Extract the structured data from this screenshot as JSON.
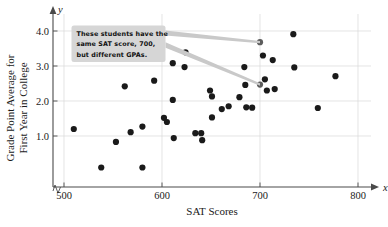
{
  "chart_data": {
    "type": "scatter",
    "title": "",
    "xlabel": "SAT Scores",
    "ylabel": "Grade Point Average for First Year in College",
    "x_var": "x",
    "y_var": "y",
    "xlim": [
      490,
      815
    ],
    "ylim": [
      0,
      4.35
    ],
    "xticks": [
      500,
      600,
      700,
      800
    ],
    "xtick_labels": [
      "500",
      "600",
      "700",
      "800"
    ],
    "yticks": [
      1.0,
      2.0,
      3.0,
      4.0
    ],
    "ytick_labels": [
      "1.0",
      "2.0",
      "3.0",
      "4.0"
    ],
    "grid": true,
    "grid_color": "#d9d9d9",
    "axis_break": true,
    "marker_color": "#1a1a1a",
    "marker_size": 3.1,
    "legend": null,
    "points": [
      {
        "x": 510,
        "y": 1.2
      },
      {
        "x": 538,
        "y": 0.1
      },
      {
        "x": 553,
        "y": 0.83
      },
      {
        "x": 562,
        "y": 2.42
      },
      {
        "x": 568,
        "y": 1.11
      },
      {
        "x": 580,
        "y": 0.1
      },
      {
        "x": 580,
        "y": 1.27
      },
      {
        "x": 592,
        "y": 2.58
      },
      {
        "x": 602,
        "y": 1.52
      },
      {
        "x": 605,
        "y": 1.4
      },
      {
        "x": 611,
        "y": 3.08
      },
      {
        "x": 611,
        "y": 2.03
      },
      {
        "x": 612,
        "y": 0.94
      },
      {
        "x": 623,
        "y": 2.97
      },
      {
        "x": 624,
        "y": 3.39
      },
      {
        "x": 634,
        "y": 1.08
      },
      {
        "x": 640,
        "y": 1.08
      },
      {
        "x": 641,
        "y": 0.88
      },
      {
        "x": 649,
        "y": 2.3
      },
      {
        "x": 651,
        "y": 2.13
      },
      {
        "x": 651,
        "y": 1.53
      },
      {
        "x": 661,
        "y": 1.77
      },
      {
        "x": 668,
        "y": 1.85
      },
      {
        "x": 679,
        "y": 2.11
      },
      {
        "x": 684,
        "y": 2.97
      },
      {
        "x": 685,
        "y": 2.46
      },
      {
        "x": 686,
        "y": 1.82
      },
      {
        "x": 692,
        "y": 1.81
      },
      {
        "x": 700,
        "y": 3.68
      },
      {
        "x": 700,
        "y": 2.47
      },
      {
        "x": 703,
        "y": 3.3
      },
      {
        "x": 705,
        "y": 2.62
      },
      {
        "x": 707,
        "y": 2.3
      },
      {
        "x": 713,
        "y": 3.17
      },
      {
        "x": 715,
        "y": 2.34
      },
      {
        "x": 734,
        "y": 3.91
      },
      {
        "x": 735,
        "y": 2.96
      },
      {
        "x": 759,
        "y": 1.8
      },
      {
        "x": 777,
        "y": 2.71
      }
    ],
    "highlighted_points": [
      {
        "x": 700,
        "y": 3.68
      },
      {
        "x": 700,
        "y": 2.47
      }
    ],
    "annotations": [
      {
        "name": "callout",
        "lines": [
          "These students have the",
          "same SAT score, 700,",
          "but different GPAs."
        ],
        "box_fill": "#d6d6d6",
        "pointer_color": "#c9c9c9",
        "targets": [
          {
            "x": 700,
            "y": 3.68
          },
          {
            "x": 700,
            "y": 2.47
          }
        ]
      }
    ]
  }
}
